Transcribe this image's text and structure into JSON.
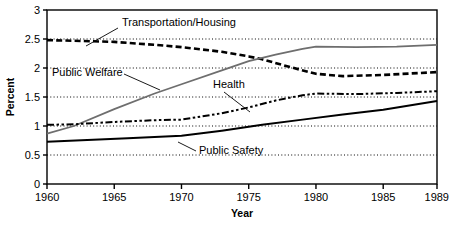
{
  "chart_data": {
    "type": "line",
    "title": "",
    "xlabel": "Year",
    "ylabel": "Percent",
    "xlim": [
      1960,
      1989
    ],
    "ylim": [
      0,
      3
    ],
    "grid": true,
    "grid_style": "dotted horizontal",
    "legend_position": "inline annotations with leader lines",
    "xticks": [
      "1960",
      "1965",
      "1970",
      "1975",
      "1980",
      "1985",
      "1989"
    ],
    "xtick_values": [
      1960,
      1965,
      1970,
      1975,
      1980,
      1985,
      1989
    ],
    "yticks": [
      "0",
      "0.5",
      "1",
      "1.5",
      "2",
      "2.5",
      "3"
    ],
    "ytick_values": [
      0,
      0.5,
      1,
      1.5,
      2,
      2.5,
      3
    ],
    "series": [
      {
        "name": "Transportation/Housing",
        "style": "bold-dashed",
        "color": "#000000",
        "x": [
          1960,
          1962,
          1965,
          1968,
          1970,
          1973,
          1975,
          1976,
          1978,
          1980,
          1982,
          1985,
          1989
        ],
        "values": [
          2.48,
          2.47,
          2.45,
          2.4,
          2.36,
          2.28,
          2.2,
          2.15,
          2.02,
          1.9,
          1.86,
          1.88,
          1.93
        ]
      },
      {
        "name": "Public Welfare",
        "style": "solid-gray",
        "color": "#6e6e6e",
        "x": [
          1960,
          1962,
          1965,
          1968,
          1970,
          1973,
          1975,
          1977,
          1979,
          1980,
          1983,
          1986,
          1989
        ],
        "values": [
          0.87,
          1.0,
          1.29,
          1.56,
          1.72,
          1.96,
          2.12,
          2.23,
          2.33,
          2.37,
          2.36,
          2.37,
          2.4
        ]
      },
      {
        "name": "Health",
        "style": "dash-dot-dot",
        "color": "#000000",
        "x": [
          1960,
          1962,
          1965,
          1968,
          1970,
          1973,
          1975,
          1977,
          1979,
          1980,
          1983,
          1986,
          1989
        ],
        "values": [
          1.02,
          1.03,
          1.07,
          1.1,
          1.11,
          1.22,
          1.32,
          1.44,
          1.53,
          1.56,
          1.55,
          1.57,
          1.6
        ]
      },
      {
        "name": "Public Safety",
        "style": "solid-black",
        "color": "#000000",
        "x": [
          1960,
          1963,
          1966,
          1968,
          1970,
          1973,
          1976,
          1979,
          1982,
          1985,
          1989
        ],
        "values": [
          0.73,
          0.76,
          0.79,
          0.81,
          0.83,
          0.92,
          1.02,
          1.11,
          1.2,
          1.28,
          1.43
        ]
      }
    ],
    "annotations": [
      {
        "label": "Transportation/Housing",
        "text_x": 122,
        "text_y": 26,
        "leader": [
          [
            118,
            28
          ],
          [
            86,
            46
          ]
        ]
      },
      {
        "label": "Public Welfare",
        "text_x": 52,
        "text_y": 76,
        "leader": [
          [
            124,
            74
          ],
          [
            160,
            90
          ]
        ]
      },
      {
        "label": "Health",
        "text_x": 213,
        "text_y": 88,
        "leader": [
          [
            224,
            92
          ],
          [
            250,
            112
          ]
        ]
      },
      {
        "label": "Public Safety",
        "text_x": 199,
        "text_y": 154,
        "leader": [
          [
            196,
            151
          ],
          [
            178,
            142
          ]
        ]
      }
    ]
  }
}
